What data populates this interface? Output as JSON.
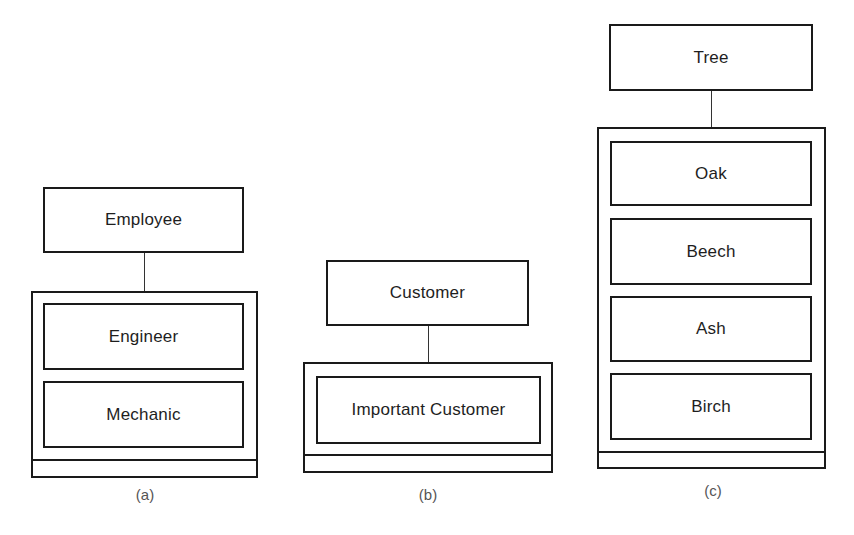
{
  "diagrams": [
    {
      "caption": "(a)",
      "parent": "Employee",
      "children": [
        "Engineer",
        "Mechanic"
      ]
    },
    {
      "caption": "(b)",
      "parent": "Customer",
      "children": [
        "Important Customer"
      ]
    },
    {
      "caption": "(c)",
      "parent": "Tree",
      "children": [
        "Oak",
        "Beech",
        "Ash",
        "Birch"
      ]
    }
  ],
  "colors": {
    "stroke": "#1a1a1a",
    "text": "#1e1e1e",
    "caption": "#555555",
    "background": "#ffffff"
  }
}
